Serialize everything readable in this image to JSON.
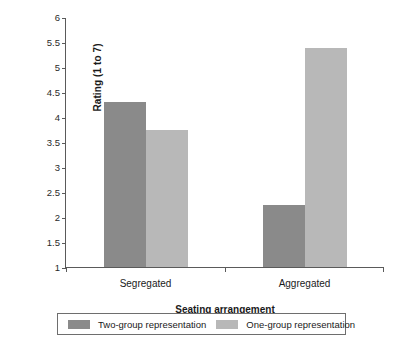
{
  "chart_data": {
    "type": "bar",
    "title": "",
    "subtitle": "",
    "xlabel": "Seating arrangement",
    "ylabel": "Rating (1 to 7)",
    "categories": [
      "Segregated",
      "Aggregated"
    ],
    "series": [
      {
        "name": "Two-group representation",
        "color": "#8a8a8a",
        "values": [
          4.3,
          2.25
        ]
      },
      {
        "name": "One-group representation",
        "color": "#b8b8b8",
        "values": [
          3.75,
          5.38
        ]
      }
    ],
    "ylim": [
      1,
      6
    ],
    "ytick_step": 0.5,
    "yticks": [
      "6",
      "5.5",
      "5",
      "4.5",
      "4",
      "3.5",
      "3",
      "2.5",
      "2",
      "1.5",
      "1"
    ],
    "grid": false,
    "legend_position": "bottom",
    "axis_color": "#5a5a5a"
  }
}
